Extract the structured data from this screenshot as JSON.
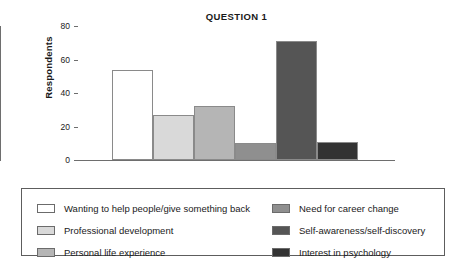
{
  "chart_data": {
    "type": "bar",
    "title": "QUESTION 1",
    "xlabel": "",
    "ylabel": "Respondents",
    "ylim": [
      0,
      80
    ],
    "yticks": [
      0,
      20,
      40,
      60,
      80
    ],
    "grid": false,
    "legend_position": "below",
    "categories": [
      "Wanting to help people/give something back",
      "Professional development",
      "Personal life experience",
      "Need for career change",
      "Self-awareness/self-discovery",
      "Interest in psychology"
    ],
    "values": [
      54,
      27,
      32,
      10,
      71,
      11
    ],
    "colors": [
      "#ffffff",
      "#d9d9d9",
      "#b5b5b5",
      "#8f8f8f",
      "#555555",
      "#333333"
    ]
  },
  "legend": {
    "left_column": [
      {
        "label": "Wanting to help people/give something back",
        "color": "#ffffff"
      },
      {
        "label": "Professional development",
        "color": "#d9d9d9"
      },
      {
        "label": "Personal life experience",
        "color": "#b5b5b5"
      }
    ],
    "right_column": [
      {
        "label": "Need for career change",
        "color": "#8f8f8f"
      },
      {
        "label": "Self-awareness/self-discovery",
        "color": "#555555"
      },
      {
        "label": "Interest in psychology",
        "color": "#333333"
      }
    ]
  },
  "axis": {
    "tick_labels": [
      "80",
      "60",
      "40",
      "20",
      "0"
    ]
  }
}
